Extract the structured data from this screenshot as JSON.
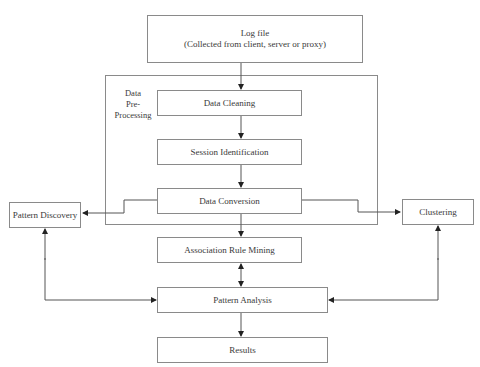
{
  "diagram": {
    "nodes": {
      "log_file": {
        "title": "Log file",
        "subtitle": "(Collected from client, server or proxy)"
      },
      "group_label": {
        "line1": "Data",
        "line2": "Pre-",
        "line3": "Processing"
      },
      "data_cleaning": "Data Cleaning",
      "session_identification": "Session Identification",
      "data_conversion": "Data Conversion",
      "pattern_discovery": "Pattern Discovery",
      "clustering": "Clustering",
      "association_rule_mining": "Association Rule Mining",
      "pattern_analysis": "Pattern Analysis",
      "results": "Results"
    },
    "edges": [
      {
        "from": "Log file",
        "to": "Data Cleaning"
      },
      {
        "from": "Data Cleaning",
        "to": "Session Identification"
      },
      {
        "from": "Session Identification",
        "to": "Data Conversion"
      },
      {
        "from": "Data Conversion",
        "to": "Pattern Discovery"
      },
      {
        "from": "Data Conversion",
        "to": "Clustering"
      },
      {
        "from": "Data Conversion",
        "to": "Association Rule Mining"
      },
      {
        "from": "Association Rule Mining",
        "to": "Pattern Analysis",
        "bidirectional": true
      },
      {
        "from": "Pattern Discovery",
        "to": "Pattern Analysis",
        "bidirectional": true
      },
      {
        "from": "Clustering",
        "to": "Pattern Analysis",
        "bidirectional": true
      },
      {
        "from": "Pattern Analysis",
        "to": "Results"
      }
    ]
  }
}
